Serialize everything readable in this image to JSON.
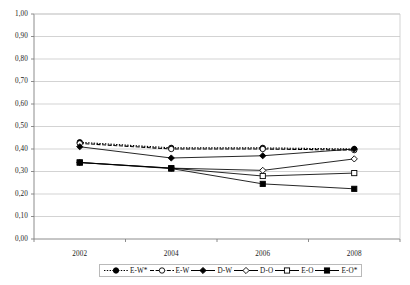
{
  "chart_data": {
    "type": "line",
    "title": "",
    "xlabel": "",
    "ylabel": "",
    "x": [
      "2002",
      "2004",
      "2006",
      "2008"
    ],
    "categories": [
      "2002",
      "2004",
      "2006",
      "2008"
    ],
    "ylim": [
      0,
      1
    ],
    "y_tick_labels": [
      "0,00",
      "0,10",
      "0,20",
      "0,30",
      "0,40",
      "0,50",
      "0,60",
      "0,70",
      "0,80",
      "0,90",
      "1,00"
    ],
    "y_tick_values": [
      0,
      0.1,
      0.2,
      0.3,
      0.4,
      0.5,
      0.6,
      0.7,
      0.8,
      0.9,
      1.0
    ],
    "x_tick_labels": [
      "2002",
      "2004",
      "2006",
      "2008"
    ],
    "grid": "horizontal",
    "legend_position": "bottom",
    "decimal_separator": ",",
    "series": [
      {
        "name": "E-W*",
        "values": [
          0.43,
          0.405,
          0.405,
          0.4
        ],
        "marker": "filled-circle",
        "line_style": "dotted",
        "color": "#000000"
      },
      {
        "name": "E-W",
        "values": [
          0.425,
          0.4,
          0.4,
          0.395
        ],
        "marker": "open-circle",
        "line_style": "dashed",
        "color": "#000000"
      },
      {
        "name": "D-W",
        "values": [
          0.41,
          0.36,
          0.37,
          0.4
        ],
        "marker": "filled-diamond",
        "line_style": "solid",
        "color": "#000000"
      },
      {
        "name": "D-O",
        "values": [
          0.34,
          0.315,
          0.305,
          0.356
        ],
        "marker": "open-diamond",
        "line_style": "solid",
        "color": "#000000"
      },
      {
        "name": "E-O",
        "values": [
          0.34,
          0.315,
          0.28,
          0.293
        ],
        "marker": "open-square",
        "line_style": "solid",
        "color": "#000000"
      },
      {
        "name": "E-O*",
        "values": [
          0.34,
          0.313,
          0.245,
          0.223
        ],
        "marker": "filled-square",
        "line_style": "solid",
        "color": "#000000"
      }
    ]
  },
  "axes": {
    "y_labels": [
      "1,00",
      "0,90",
      "0,80",
      "0,70",
      "0,60",
      "0,50",
      "0,40",
      "0,30",
      "0,20",
      "0,10",
      "0,00"
    ],
    "x_labels": [
      "2002",
      "2004",
      "2006",
      "2008"
    ]
  },
  "legend": {
    "items": [
      {
        "label": "E-W*"
      },
      {
        "label": "E-W"
      },
      {
        "label": "D-W"
      },
      {
        "label": "D-O"
      },
      {
        "label": "E-O"
      },
      {
        "label": "E-O*"
      }
    ]
  },
  "header": {
    "cropped_caption": ""
  },
  "colors": {
    "plot_line": "#000000",
    "gridline": "#c8c8c8",
    "axis": "#808080",
    "background": "#ffffff"
  }
}
